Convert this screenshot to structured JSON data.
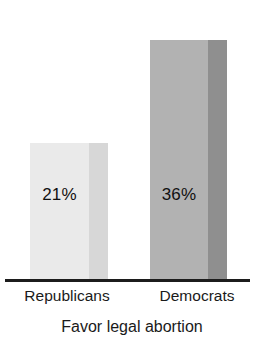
{
  "chart_data": {
    "type": "bar",
    "title": "",
    "caption": "Favor legal abortion",
    "categories": [
      "Republicans",
      "Democrats"
    ],
    "values": [
      21,
      36
    ],
    "value_labels": [
      "21%",
      "36%"
    ],
    "unit": "%",
    "xlabel": "",
    "ylabel": "",
    "ylim": [
      0,
      41
    ],
    "grid": false,
    "legend": false,
    "axis": {
      "baseline_visible": true,
      "baseline_color": "#1c1c1c",
      "y_axis_visible": false,
      "tick_labels": [
        "Republicans",
        "Democrats"
      ]
    },
    "series": [
      {
        "name": "Favor legal abortion",
        "values": [
          21,
          36
        ]
      }
    ],
    "bars": [
      {
        "category": "Republicans",
        "value": 21,
        "value_label": "21%",
        "fill_color": "#eaeaea",
        "side_color": "#d7d7d7"
      },
      {
        "category": "Democrats",
        "value": 36,
        "value_label": "36%",
        "fill_color": "#b2b2b2",
        "side_color": "#8f8f8f"
      }
    ]
  },
  "colors": {
    "background": "#ffffff",
    "text": "#1a1a1a",
    "baseline": "#1c1c1c"
  }
}
